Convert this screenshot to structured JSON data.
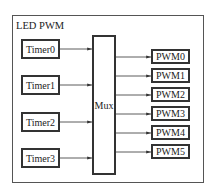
{
  "title": "LED PWM",
  "mux": {
    "label": "Mux"
  },
  "timers": [
    {
      "label": "Timer0",
      "top": 39
    },
    {
      "label": "Timer1",
      "top": 75
    },
    {
      "label": "Timer2",
      "top": 112
    },
    {
      "label": "Timer3",
      "top": 148
    }
  ],
  "pwms": [
    {
      "label": "PWM0",
      "top": 49
    },
    {
      "label": "PWM1",
      "top": 68
    },
    {
      "label": "PWM2",
      "top": 87
    },
    {
      "label": "PWM3",
      "top": 106
    },
    {
      "label": "PWM4",
      "top": 125
    },
    {
      "label": "PWM5",
      "top": 144
    }
  ],
  "colors": {
    "line": "#333333",
    "frame": "#555555"
  }
}
